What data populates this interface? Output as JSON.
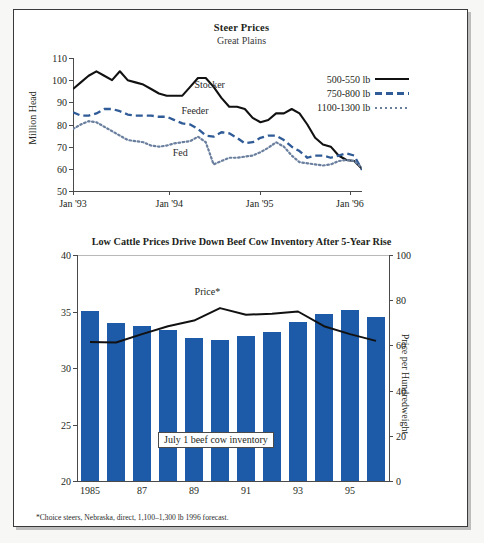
{
  "chart_data": [
    {
      "type": "line",
      "title": "Steer Prices",
      "subtitle": "Great Plains",
      "ylabel": "Price per Hundredweight",
      "xlabel": "",
      "ylim": [
        50,
        110
      ],
      "yticks": [
        50,
        60,
        70,
        80,
        90,
        100,
        110
      ],
      "xticks": [
        "Jan '93",
        "Jan '94",
        "Jan '95",
        "Jan '96"
      ],
      "xtick_positions": [
        0,
        0.3333,
        0.6458,
        0.9583
      ],
      "grid": false,
      "legend_position": "upper-right",
      "annotations": [
        {
          "text": "Stocker",
          "x": 0.42,
          "y": 97.5
        },
        {
          "text": "Feeder",
          "x": 0.375,
          "y": 85.5
        },
        {
          "text": "Fed",
          "x": 0.345,
          "y": 66.5
        }
      ],
      "series": [
        {
          "name": "500-550 lb",
          "legend_label": "500-550 lb",
          "style": "solid",
          "color": "#111111",
          "inline_label": "Stocker",
          "x": [
            0,
            1,
            2,
            3,
            4,
            5,
            6,
            7,
            8,
            9,
            10,
            11,
            12,
            13,
            14,
            15,
            16,
            17,
            18,
            19,
            20,
            21,
            22,
            23,
            24,
            25,
            26,
            27,
            28,
            29,
            30,
            31,
            32,
            33,
            34,
            35,
            36
          ],
          "values": [
            96,
            99,
            102,
            104,
            102,
            100,
            104,
            100,
            99,
            98,
            96,
            94,
            93,
            93,
            93,
            97,
            101,
            101,
            97,
            92,
            88,
            88,
            87,
            83,
            81,
            82,
            85,
            85,
            87,
            85,
            80,
            74,
            71,
            70,
            66,
            64,
            63.5,
            60
          ]
        },
        {
          "name": "750-800 lb",
          "legend_label": "750-800 lb",
          "style": "dashed",
          "color": "#2f5b97",
          "inline_label": "Feeder",
          "x": [
            0,
            1,
            2,
            3,
            4,
            5,
            6,
            7,
            8,
            9,
            10,
            11,
            12,
            13,
            14,
            15,
            16,
            17,
            18,
            19,
            20,
            21,
            22,
            23,
            24,
            25,
            26,
            27,
            28,
            29,
            30,
            31,
            32,
            33,
            34,
            35,
            36
          ],
          "values": [
            85.5,
            84,
            84,
            85,
            87,
            87,
            86,
            84.5,
            84,
            84,
            84,
            83.5,
            83.5,
            82,
            80.5,
            80,
            78,
            75,
            74.5,
            76.5,
            76,
            74,
            71.5,
            72,
            74,
            75,
            75,
            73,
            70,
            68,
            65,
            66,
            66,
            65,
            66,
            67,
            66,
            59.5
          ]
        },
        {
          "name": "1100-1300 lb",
          "legend_label": "1100-1300 lb",
          "style": "dotted",
          "color": "#6a7f9e",
          "inline_label": "Fed",
          "x": [
            0,
            1,
            2,
            3,
            4,
            5,
            6,
            7,
            8,
            9,
            10,
            11,
            12,
            13,
            14,
            15,
            16,
            17,
            18,
            19,
            20,
            21,
            22,
            23,
            24,
            25,
            26,
            27,
            28,
            29,
            30,
            31,
            32,
            33,
            34,
            35,
            36
          ],
          "values": [
            78,
            80,
            81.5,
            81,
            79,
            77,
            75,
            73,
            72.5,
            72,
            70.5,
            70,
            70.5,
            71.5,
            72,
            72.5,
            74.5,
            72,
            62,
            63.5,
            65,
            65,
            65.5,
            66,
            67.5,
            69.5,
            72,
            70,
            66,
            63,
            62.5,
            62,
            61.5,
            62,
            63.5,
            64,
            63.5,
            60.5
          ]
        }
      ]
    },
    {
      "type": "bar",
      "title": "Low Cattle Prices Drive Down Beef Cow Inventory After 5-Year Rise",
      "ylabel_left": "Million Head",
      "ylabel_right": "Price per Hundredweight",
      "ylim_left": [
        20,
        40
      ],
      "yticks_left": [
        20,
        25,
        30,
        35,
        40
      ],
      "ylim_right": [
        0,
        100
      ],
      "yticks_right": [
        0,
        20,
        40,
        60,
        80,
        100
      ],
      "categories": [
        "1985",
        "86",
        "87",
        "88",
        "89",
        "90",
        "91",
        "92",
        "93",
        "94",
        "95",
        "96"
      ],
      "xtick_labels": [
        "1985",
        "87",
        "89",
        "91",
        "93",
        "95"
      ],
      "xtick_indices": [
        0,
        2,
        4,
        6,
        8,
        10
      ],
      "bar_color": "#1d5aa7",
      "bar_series_name": "July 1 beef cow inventory",
      "values": [
        35.05,
        34.0,
        33.75,
        33.35,
        32.65,
        32.5,
        32.8,
        33.2,
        34.05,
        34.75,
        35.15,
        34.55
      ],
      "line_series_name": "Price*",
      "line_color": "#111111",
      "line_values": [
        61.5,
        61.3,
        65.0,
        68.5,
        71.0,
        76.5,
        73.6,
        74.0,
        75.0,
        68.5,
        65.0,
        62.0
      ],
      "annotations": [
        {
          "text": "Price*",
          "x_index": 4.6,
          "y": 83
        },
        {
          "text": "July 1 beef cow inventory",
          "x_index": 5.0,
          "y": 23.6
        }
      ],
      "footnote": "*Choice steers, Nebraska, direct, 1,100–1,300 lb 1996 forecast."
    }
  ]
}
